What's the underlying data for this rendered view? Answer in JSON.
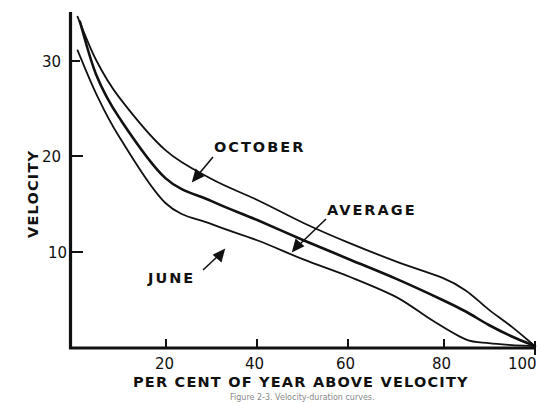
{
  "chart_data": {
    "type": "line",
    "title": "",
    "xlabel": "PER CENT OF YEAR ABOVE VELOCITY",
    "ylabel": "VELOCITY",
    "xlim": [
      0,
      100
    ],
    "ylim": [
      0,
      35
    ],
    "xticks": [
      20,
      40,
      60,
      80,
      100
    ],
    "xtick_labels": [
      "20",
      "40",
      "60",
      "80",
      "100"
    ],
    "yticks": [
      10,
      20,
      30
    ],
    "ytick_labels": [
      "10",
      "20",
      "30"
    ],
    "grid": false,
    "legend": "none (curves labeled directly with arrows)",
    "series": [
      {
        "name": "OCTOBER",
        "x": [
          1,
          5,
          10,
          20,
          30,
          40,
          50,
          60,
          70,
          80,
          85,
          90,
          95,
          100
        ],
        "y": [
          34.5,
          30.0,
          26.1,
          20.6,
          17.6,
          15.4,
          13.0,
          10.9,
          9.0,
          7.3,
          6.0,
          4.0,
          2.2,
          0.2
        ]
      },
      {
        "name": "AVERAGE",
        "x": [
          1.5,
          5,
          10,
          20,
          30,
          40,
          50,
          60,
          70,
          80,
          85,
          90,
          95,
          100
        ],
        "y": [
          34.0,
          28.5,
          24.0,
          17.7,
          15.3,
          13.3,
          11.2,
          9.2,
          7.2,
          5.0,
          3.8,
          2.4,
          1.2,
          0.2
        ]
      },
      {
        "name": "JUNE",
        "x": [
          1,
          5,
          10,
          20,
          30,
          40,
          50,
          60,
          70,
          78,
          85,
          90,
          95,
          100
        ],
        "y": [
          31.0,
          26.5,
          22.0,
          15.1,
          12.9,
          11.2,
          9.2,
          7.4,
          5.3,
          2.8,
          0.9,
          0.5,
          0.3,
          0.2
        ]
      }
    ],
    "annotations": [
      {
        "text": "OCTOBER",
        "points_to_series": "OCTOBER"
      },
      {
        "text": "AVERAGE",
        "points_to_series": "AVERAGE"
      },
      {
        "text": "JUNE",
        "points_to_series": "JUNE"
      }
    ],
    "caption": "Figure 2-3. Velocity-duration curves."
  },
  "labels": {
    "ylabel": "VELOCITY",
    "xlabel": "PER CENT OF YEAR ABOVE VELOCITY",
    "y30": "30",
    "y20": "20",
    "y10": "10",
    "x20": "20",
    "x40": "40",
    "x60": "60",
    "x80": "80",
    "x100": "100",
    "october": "OCTOBER",
    "average": "AVERAGE",
    "june": "JUNE",
    "caption": "Figure 2-3. Velocity-duration curves."
  }
}
